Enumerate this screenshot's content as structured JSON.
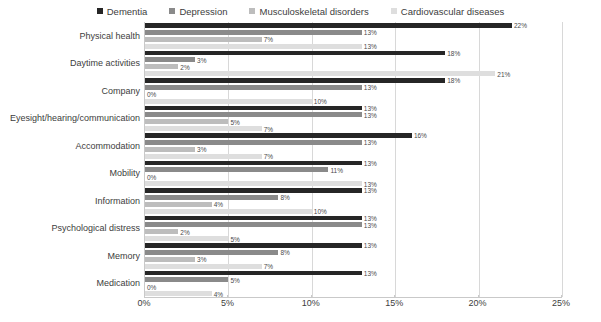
{
  "chart_data": {
    "type": "bar",
    "orientation": "horizontal",
    "title": "",
    "subtitle": "",
    "xlabel": "",
    "ylabel": "",
    "xlim": [
      0,
      25
    ],
    "xticks": [
      "0%",
      "5%",
      "10%",
      "15%",
      "20%",
      "25%"
    ],
    "xtick_values": [
      0,
      5,
      10,
      15,
      20,
      25
    ],
    "grid": true,
    "legend_position": "top",
    "value_suffix": "%",
    "categories": [
      "Physical health",
      "Daytime activities",
      "Company",
      "Eyesight/hearing/communication",
      "Accommodation",
      "Mobility",
      "Information",
      "Psychological distress",
      "Memory",
      "Medication"
    ],
    "series": [
      {
        "name": "Dementia",
        "color": "#262626",
        "values": [
          22,
          18,
          18,
          13,
          16,
          13,
          13,
          13,
          13,
          13
        ],
        "labels": [
          "22%",
          "18%",
          "18%",
          "13%",
          "16%",
          "13%",
          "13%",
          "13%",
          "13%",
          "13%"
        ]
      },
      {
        "name": "Depression",
        "color": "#8a8a8a",
        "values": [
          13,
          3,
          13,
          13,
          13,
          11,
          8,
          13,
          8,
          5
        ],
        "labels": [
          "13%",
          "3%",
          "13%",
          "13%",
          "13%",
          "11%",
          "8%",
          "13%",
          "8%",
          "5%"
        ]
      },
      {
        "name": "Musculoskeletal disorders",
        "color": "#bdbdbd",
        "values": [
          7,
          2,
          0,
          5,
          3,
          0,
          4,
          2,
          3,
          0
        ],
        "labels": [
          "7%",
          "2%",
          "0%",
          "5%",
          "3%",
          "0%",
          "4%",
          "2%",
          "3%",
          "0%"
        ]
      },
      {
        "name": "Cardiovascular diseases",
        "color": "#dedede",
        "values": [
          13,
          21,
          10,
          7,
          7,
          13,
          10,
          5,
          7,
          4
        ],
        "labels": [
          "13%",
          "21%",
          "10%",
          "7%",
          "7%",
          "13%",
          "10%",
          "5%",
          "7%",
          "4%"
        ]
      }
    ]
  }
}
